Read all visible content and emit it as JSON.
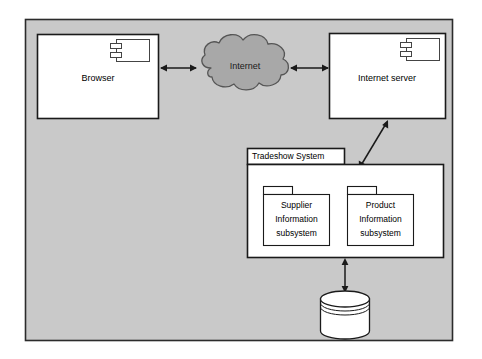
{
  "canvas": {
    "width": 482,
    "height": 359,
    "page_background": "#ffffff",
    "panel_background": "#c9c9c9",
    "panel_border": "#2b2b2b"
  },
  "diagram": {
    "type": "uml-deployment-diagram",
    "nodes": [
      {
        "id": "browser",
        "kind": "component",
        "label": "Browser",
        "icon": "component-icon",
        "fill": "#ffffff",
        "stroke": "#1a1a1a"
      },
      {
        "id": "internet",
        "kind": "cloud",
        "label": "Internet",
        "icon": "cloud-icon",
        "fill": "#a8a8a8",
        "stroke": "#555555"
      },
      {
        "id": "internet-server",
        "kind": "component",
        "label": "Internet server",
        "icon": "component-icon",
        "fill": "#ffffff",
        "stroke": "#1a1a1a"
      },
      {
        "id": "tradeshow-system",
        "kind": "package",
        "label": "Tradeshow System",
        "icon": "package-icon",
        "fill": "#ffffff",
        "stroke": "#1a1a1a"
      },
      {
        "id": "supplier-information-subsystem",
        "kind": "package",
        "label": "Supplier Information subsystem",
        "label_lines": [
          "Supplier",
          "Information",
          "subsystem"
        ],
        "icon": "package-icon",
        "fill": "#ffffff",
        "stroke": "#1a1a1a"
      },
      {
        "id": "product-information-subsystem",
        "kind": "package",
        "label": "Product Information subsystem",
        "label_lines": [
          "Product",
          "Information",
          "subsystem"
        ],
        "icon": "package-icon",
        "fill": "#ffffff",
        "stroke": "#1a1a1a"
      },
      {
        "id": "database",
        "kind": "datastore",
        "label": "",
        "icon": "database-cylinder-icon",
        "fill": "#ffffff",
        "stroke": "#1a1a1a"
      }
    ],
    "connections": [
      {
        "id": "browser-internet",
        "from": "browser",
        "to": "internet",
        "arrow": "double",
        "orientation": "horizontal"
      },
      {
        "id": "internet-server-link",
        "from": "internet",
        "to": "internet-server",
        "arrow": "double",
        "orientation": "horizontal"
      },
      {
        "id": "server-tradeshow",
        "from": "internet-server",
        "to": "tradeshow-system",
        "arrow": "double",
        "orientation": "diagonal"
      },
      {
        "id": "tradeshow-database",
        "from": "tradeshow-system",
        "to": "database",
        "arrow": "double",
        "orientation": "vertical"
      }
    ]
  }
}
